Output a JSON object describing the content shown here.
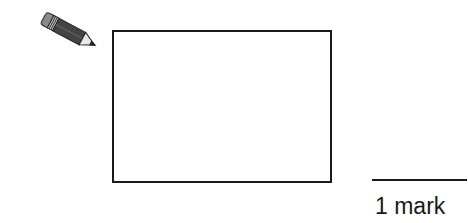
{
  "question": {
    "icon": "pencil-icon",
    "answer_box": {
      "content": ""
    },
    "marks": {
      "label": "1 mark"
    }
  },
  "colors": {
    "ink": "#1a1a1a",
    "background": "#ffffff"
  }
}
